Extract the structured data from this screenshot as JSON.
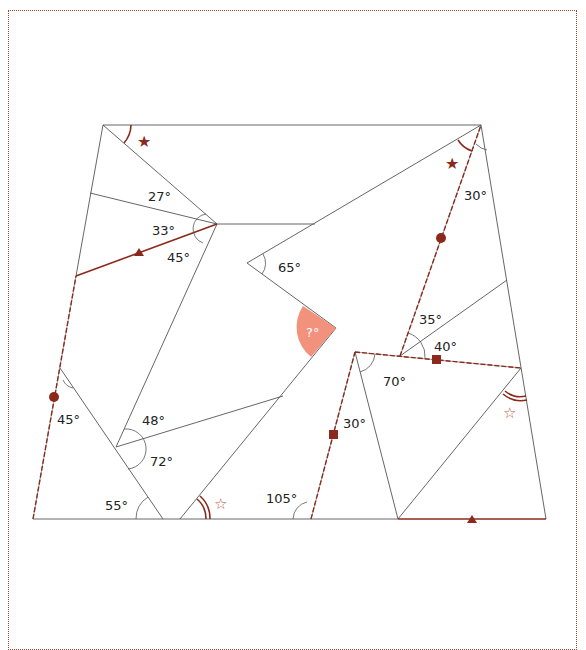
{
  "diagram": {
    "colors": {
      "line": "#555555",
      "accent": "#8b2a1c",
      "unknown_fill": "#f2917c",
      "border": "#a0402a"
    },
    "angles": [
      {
        "id": "a27",
        "label": "27°"
      },
      {
        "id": "a33",
        "label": "33°"
      },
      {
        "id": "a45top",
        "label": "45°"
      },
      {
        "id": "a65",
        "label": "65°"
      },
      {
        "id": "a30top",
        "label": "30°"
      },
      {
        "id": "a35",
        "label": "35°"
      },
      {
        "id": "a40",
        "label": "40°"
      },
      {
        "id": "a70",
        "label": "70°"
      },
      {
        "id": "a30mid",
        "label": "30°"
      },
      {
        "id": "a45left",
        "label": "45°"
      },
      {
        "id": "a48",
        "label": "48°"
      },
      {
        "id": "a72",
        "label": "72°"
      },
      {
        "id": "a55",
        "label": "55°"
      },
      {
        "id": "a105",
        "label": "105°"
      },
      {
        "id": "unknown",
        "label": "?°"
      }
    ],
    "markers": {
      "filled_star": "★",
      "outline_star": "☆"
    }
  }
}
